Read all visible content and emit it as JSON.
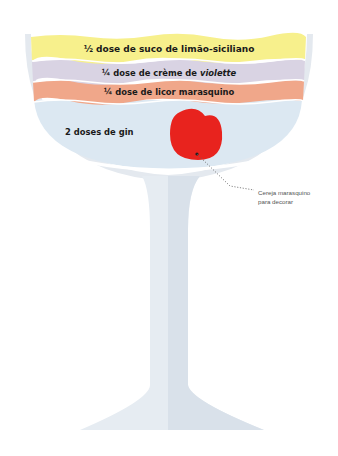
{
  "diagram": {
    "type": "cocktail-glass-recipe",
    "glass": "coupe",
    "layers": [
      {
        "label": "½ dose de suco de limão-siciliano",
        "color": "#f7f08c"
      },
      {
        "label_prefix": "¼ dose de crème de ",
        "label_italic": "violette",
        "color": "#d9d3e3"
      },
      {
        "label": "¼ dose de licor marasquino",
        "color": "#f0a78a"
      },
      {
        "label": "2 doses de gin",
        "color": "#dce8f2"
      }
    ],
    "garnish": {
      "name": "cherry",
      "color": "#e8231e",
      "callout_line1": "Cereja marasquino",
      "callout_line2": "para decorar"
    },
    "colors": {
      "glass": "#e6ecf2",
      "glass_shadow": "#d2dbe4",
      "rim": "#e4e9ef",
      "text": "#1a1a1a",
      "callout_text": "#555555"
    }
  }
}
